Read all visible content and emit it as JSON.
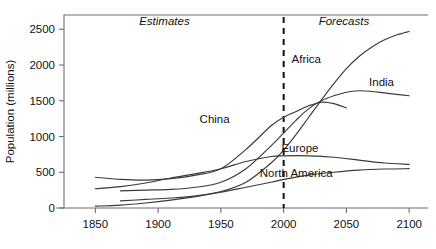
{
  "chart_data": {
    "type": "line",
    "title": "",
    "xlabel": "",
    "ylabel": "Population (millions)",
    "xlim": [
      1825,
      2115
    ],
    "ylim": [
      0,
      2700
    ],
    "grid": false,
    "legend_position": "inline-labels",
    "xticks": [
      1850,
      1900,
      1950,
      2000,
      2050,
      2100
    ],
    "xticklabels": [
      "1850",
      "1900",
      "1950",
      "2000",
      "2050",
      "2100"
    ],
    "yticks": [
      0,
      500,
      1000,
      1500,
      2000,
      2500
    ],
    "yticklabels": [
      "0",
      "500",
      "1000",
      "1500",
      "2000",
      "2500"
    ],
    "annotations": [
      {
        "text": "Estimates",
        "x": 1905,
        "y": 2560,
        "style": "italic"
      },
      {
        "text": "Forecasts",
        "x": 2048,
        "y": 2560,
        "style": "italic"
      }
    ],
    "divider": {
      "x": 2000,
      "label": "estimates-forecasts-divider",
      "style": "dashed"
    },
    "series": [
      {
        "name": "Africa",
        "label_x": 2018,
        "label_y": 2030,
        "x": [
          1870,
          1890,
          1910,
          1930,
          1950,
          1970,
          1990,
          2000,
          2010,
          2020,
          2030,
          2040,
          2050,
          2060,
          2070,
          2080,
          2090,
          2100
        ],
        "values": [
          100,
          120,
          140,
          170,
          230,
          360,
          630,
          810,
          1030,
          1270,
          1510,
          1740,
          1950,
          2120,
          2250,
          2350,
          2420,
          2470
        ]
      },
      {
        "name": "India",
        "label_x": 2078,
        "label_y": 1700,
        "x": [
          1870,
          1890,
          1910,
          1930,
          1950,
          1970,
          1990,
          2000,
          2010,
          2020,
          2030,
          2040,
          2050,
          2060,
          2070,
          2080,
          2090,
          2100
        ],
        "values": [
          240,
          250,
          260,
          290,
          360,
          550,
          870,
          1050,
          1230,
          1390,
          1500,
          1570,
          1620,
          1640,
          1630,
          1610,
          1590,
          1570
        ]
      },
      {
        "name": "China",
        "label_x": 1945,
        "label_y": 1190,
        "x": [
          1850,
          1870,
          1890,
          1910,
          1930,
          1950,
          1970,
          1990,
          2000,
          2010,
          2020,
          2030,
          2040,
          2050
        ],
        "values": [
          430,
          400,
          390,
          410,
          460,
          550,
          820,
          1150,
          1270,
          1350,
          1430,
          1480,
          1460,
          1400
        ]
      },
      {
        "name": "Europe",
        "label_x": 2013,
        "label_y": 790,
        "x": [
          1850,
          1870,
          1890,
          1910,
          1930,
          1950,
          1970,
          1990,
          2000,
          2020,
          2040,
          2060,
          2080,
          2100
        ],
        "values": [
          270,
          300,
          350,
          420,
          480,
          550,
          650,
          720,
          730,
          730,
          710,
          670,
          630,
          610
        ]
      },
      {
        "name": "North America",
        "label_x": 2010,
        "label_y": 430,
        "x": [
          1850,
          1870,
          1890,
          1910,
          1930,
          1950,
          1970,
          1990,
          2000,
          2020,
          2040,
          2060,
          2080,
          2100
        ],
        "values": [
          26,
          40,
          70,
          110,
          160,
          220,
          290,
          360,
          400,
          460,
          500,
          530,
          545,
          550
        ]
      }
    ]
  }
}
